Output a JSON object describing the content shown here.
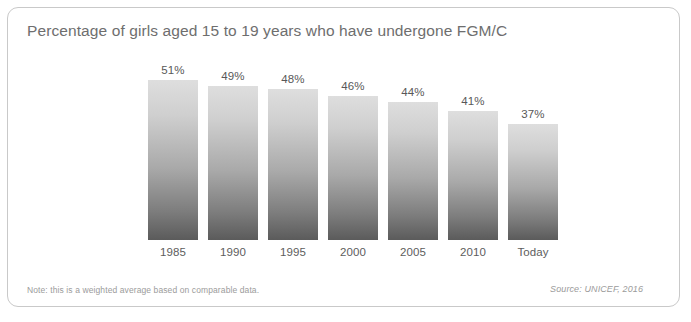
{
  "card": {
    "title": "Percentage of girls aged 15 to 19 years who have undergone FGM/C",
    "note": "Note: this is a weighted average based on comparable data.",
    "source": "Source: UNICEF, 2016"
  },
  "colors": {
    "card_border": "#c9c9c9",
    "title_text": "#6e6e6e",
    "bar_top": "#dedede",
    "bar_bottom": "#5b5b5b",
    "label_text": "#5d5d5d",
    "footer_text": "#9b9b9b"
  },
  "chart_data": {
    "type": "bar",
    "title": "Percentage of girls aged 15 to 19 years who have undergone FGM/C",
    "xlabel": "",
    "ylabel": "",
    "ylim": [
      0,
      60
    ],
    "grid": false,
    "legend": "none",
    "categories": [
      "1985",
      "1990",
      "1995",
      "2000",
      "2005",
      "2010",
      "Today"
    ],
    "values": [
      51,
      49,
      48,
      46,
      44,
      41,
      37
    ],
    "value_labels": [
      "51%",
      "49%",
      "48%",
      "46%",
      "44%",
      "41%",
      "37%"
    ],
    "note": "Note: this is a weighted average based on comparable data.",
    "source": "Source: UNICEF, 2016"
  }
}
